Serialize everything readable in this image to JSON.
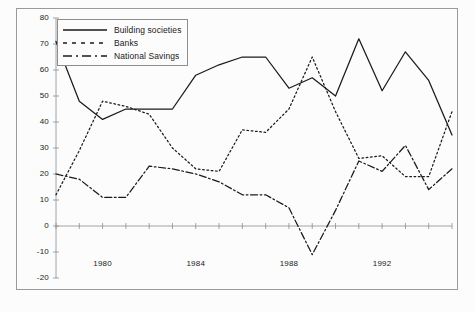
{
  "chart_data": {
    "type": "line",
    "title": "",
    "xlabel": "",
    "ylabel": "",
    "xlim": [
      1978,
      1995
    ],
    "ylim": [
      -20,
      80
    ],
    "grid": false,
    "legend_position": "top-left",
    "y_ticks": [
      80,
      70,
      60,
      50,
      40,
      30,
      20,
      10,
      0,
      -10,
      -20
    ],
    "x_ticks": [
      1978,
      1979,
      1980,
      1981,
      1982,
      1983,
      1984,
      1985,
      1986,
      1987,
      1988,
      1989,
      1990,
      1991,
      1992,
      1993,
      1994,
      1995
    ],
    "x_tick_labels": [
      "",
      "",
      "1980",
      "",
      "",
      "",
      "1984",
      "",
      "",
      "",
      "1988",
      "",
      "",
      "",
      "1992",
      "",
      "",
      ""
    ],
    "x": [
      1978,
      1979,
      1980,
      1981,
      1982,
      1983,
      1984,
      1985,
      1986,
      1987,
      1988,
      1989,
      1990,
      1991,
      1992,
      1993,
      1994,
      1995
    ],
    "series": [
      {
        "name": "Building societies",
        "style": "solid",
        "color": "#1a1a1a",
        "values": [
          71,
          48,
          41,
          45,
          45,
          45,
          58,
          62,
          65,
          65,
          53,
          57,
          50,
          72,
          52,
          67,
          56,
          35
        ]
      },
      {
        "name": "Banks",
        "style": "dotted",
        "color": "#1a1a1a",
        "values": [
          12,
          29,
          48,
          46,
          43,
          30,
          22,
          21,
          37,
          36,
          45,
          65,
          44,
          26,
          27,
          19,
          19,
          44
        ]
      },
      {
        "name": "National Savings",
        "style": "dashdot",
        "color": "#1a1a1a",
        "values": [
          20,
          18,
          11,
          11,
          23,
          22,
          20,
          17,
          12,
          12,
          7,
          -11,
          6,
          25,
          21,
          31,
          14,
          22
        ]
      }
    ]
  },
  "legend": {
    "items": [
      {
        "label": "Building societies",
        "key": "solid-line-key"
      },
      {
        "label": "Banks",
        "key": "dotted-line-key"
      },
      {
        "label": "National Savings",
        "key": "dashdot-line-key"
      }
    ]
  },
  "axes": {
    "y_tick_labels": [
      "80",
      "70",
      "60",
      "50",
      "40",
      "30",
      "20",
      "10",
      "0",
      "-10",
      "-20"
    ],
    "x_tick_labels_visible": [
      "1980",
      "1984",
      "1988",
      "1992"
    ]
  }
}
